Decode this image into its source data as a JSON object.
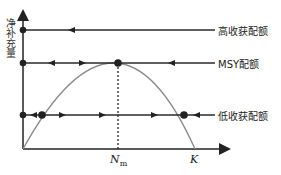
{
  "diagram": {
    "y_axis_label": "净补充量",
    "x_axis_labels": {
      "nm_main": "N",
      "nm_sub": "m",
      "k": "K"
    },
    "lines": [
      {
        "id": "high",
        "label": "高收获配额",
        "y": 30
      },
      {
        "id": "msy",
        "label": "MSY配额",
        "y": 63
      },
      {
        "id": "low",
        "label": "低收获配额",
        "y": 115
      }
    ],
    "colors": {
      "axis": "#222222",
      "curve": "#8a8a8a",
      "line": "#2a2a2a",
      "text": "#222222"
    }
  }
}
